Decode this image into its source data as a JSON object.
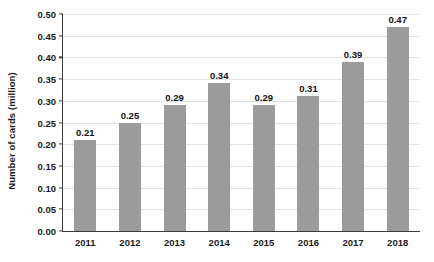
{
  "chart_data": {
    "type": "bar",
    "title": "",
    "xlabel": "",
    "ylabel": "Number of cards (million)",
    "categories": [
      "2011",
      "2012",
      "2013",
      "2014",
      "2015",
      "2016",
      "2017",
      "2018"
    ],
    "values": [
      0.21,
      0.25,
      0.29,
      0.34,
      0.29,
      0.31,
      0.39,
      0.47
    ],
    "data_labels": [
      "0.21",
      "0.25",
      "0.29",
      "0.34",
      "0.29",
      "0.31",
      "0.39",
      "0.47"
    ],
    "ylim": [
      0.0,
      0.5
    ],
    "ytick_values": [
      0.0,
      0.05,
      0.1,
      0.15,
      0.2,
      0.25,
      0.3,
      0.35,
      0.4,
      0.45,
      0.5
    ],
    "ytick_labels": [
      "0.00",
      "0.05",
      "0.10",
      "0.15",
      "0.20",
      "0.25",
      "0.30",
      "0.35",
      "0.40",
      "0.45",
      "0.50"
    ],
    "grid": true,
    "legend": false,
    "bar_color": "#9b9b9b",
    "grid_color": "#e3e3e3",
    "axis_color": "#3b3b3b",
    "background_color": "#ffffff",
    "text_color": "#1a1a1a"
  }
}
